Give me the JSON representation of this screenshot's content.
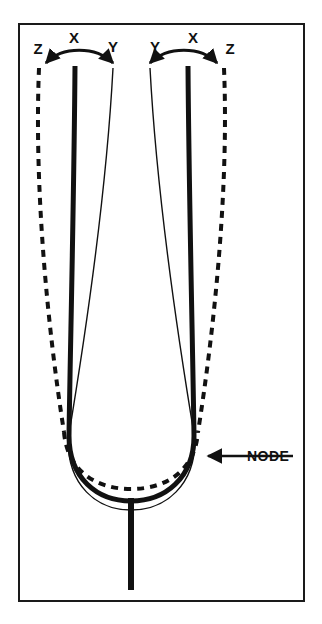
{
  "figure": {
    "frame": {
      "border_color": "#1a1a1a",
      "background_color": "#ffffff",
      "x": 18,
      "y": 23,
      "width": 286,
      "height": 578,
      "border_width": 2
    },
    "labels": {
      "left_prong": {
        "outer": "Z",
        "rest": "X",
        "inner": "Y"
      },
      "right_prong": {
        "inner": "Y",
        "rest": "X",
        "outer": "Z"
      },
      "node": "NODE"
    },
    "label_positions": [
      {
        "name": "label-z-left",
        "text": "Z",
        "x": 38,
        "y": 54
      },
      {
        "name": "label-x-left",
        "text": "X",
        "x": 74,
        "y": 43
      },
      {
        "name": "label-y-left",
        "text": "Y",
        "x": 113,
        "y": 52
      },
      {
        "name": "label-y-right",
        "text": "Y",
        "x": 155,
        "y": 52
      },
      {
        "name": "label-x-right",
        "text": "X",
        "x": 193,
        "y": 43
      },
      {
        "name": "label-z-right",
        "text": "Z",
        "x": 230,
        "y": 54
      },
      {
        "name": "label-node",
        "text": "NODE",
        "x": 247,
        "y": 461
      }
    ],
    "strokes": {
      "rest_position": {
        "style": "solid-thick",
        "width": 5,
        "color": "#111111",
        "legend": "X - rest position"
      },
      "inward_position": {
        "style": "solid-thin",
        "width": 1.4,
        "color": "#111111",
        "legend": "Y - inward deflection"
      },
      "outward_position": {
        "style": "dashed",
        "width": 4,
        "color": "#111111",
        "dash": "7 6",
        "legend": "Z - outward deflection"
      },
      "arrow": {
        "width": 3,
        "color": "#111111"
      },
      "stem": {
        "width": 6,
        "color": "#111111"
      }
    },
    "geometry": {
      "left_prong_x_top": 75,
      "right_prong_x_top": 187,
      "prong_top_y": 63,
      "bend_start_y": 440,
      "bottom_y": 505,
      "stem_x": 131,
      "stem_bottom_y": 590,
      "node_arrow_from_x": 293,
      "node_arrow_to_x": 206,
      "node_arrow_y": 456
    }
  }
}
